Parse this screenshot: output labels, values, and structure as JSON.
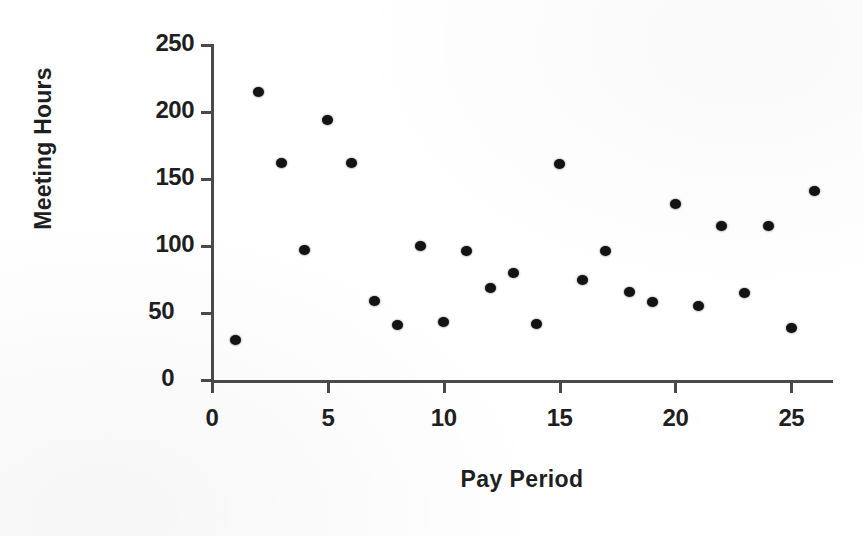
{
  "chart_data": {
    "type": "scatter",
    "title": "",
    "xlabel": "Pay Period",
    "ylabel": "Meeting Hours",
    "xlim": [
      0,
      26.8
    ],
    "ylim": [
      0,
      250
    ],
    "xticks": [
      0,
      5,
      10,
      15,
      20,
      25
    ],
    "yticks": [
      0,
      50,
      100,
      150,
      200,
      250
    ],
    "xtick_labels": [
      "0",
      "5",
      "10",
      "15",
      "20",
      "25"
    ],
    "ytick_labels": [
      "0",
      "50",
      "100",
      "150",
      "200",
      "250"
    ],
    "grid": false,
    "legend": false,
    "marker": "filled-circle",
    "marker_color": "#131313",
    "axis_color": "#4a4a4a",
    "background": "#ffffff",
    "x": [
      1,
      2,
      3,
      4,
      5,
      6,
      7,
      8,
      9,
      10,
      11,
      12,
      13,
      14,
      15,
      16,
      17,
      18,
      19,
      20,
      21,
      22,
      23,
      24,
      25,
      26
    ],
    "y": [
      30,
      215,
      162,
      97,
      194,
      162,
      59,
      41,
      100,
      43,
      96,
      69,
      80,
      42,
      161,
      75,
      96,
      66,
      58,
      131,
      55,
      115,
      65,
      115,
      39,
      141
    ],
    "points": [
      {
        "x": 1,
        "y": 30
      },
      {
        "x": 2,
        "y": 215
      },
      {
        "x": 3,
        "y": 162
      },
      {
        "x": 4,
        "y": 97
      },
      {
        "x": 5,
        "y": 194
      },
      {
        "x": 6,
        "y": 162
      },
      {
        "x": 7,
        "y": 59
      },
      {
        "x": 8,
        "y": 41
      },
      {
        "x": 9,
        "y": 100
      },
      {
        "x": 10,
        "y": 43
      },
      {
        "x": 11,
        "y": 96
      },
      {
        "x": 12,
        "y": 69
      },
      {
        "x": 13,
        "y": 80
      },
      {
        "x": 14,
        "y": 42
      },
      {
        "x": 15,
        "y": 161
      },
      {
        "x": 16,
        "y": 75
      },
      {
        "x": 17,
        "y": 96
      },
      {
        "x": 18,
        "y": 66
      },
      {
        "x": 19,
        "y": 58
      },
      {
        "x": 20,
        "y": 131
      },
      {
        "x": 21,
        "y": 55
      },
      {
        "x": 22,
        "y": 115
      },
      {
        "x": 23,
        "y": 65
      },
      {
        "x": 24,
        "y": 115
      },
      {
        "x": 25,
        "y": 39
      },
      {
        "x": 26,
        "y": 141
      }
    ]
  }
}
